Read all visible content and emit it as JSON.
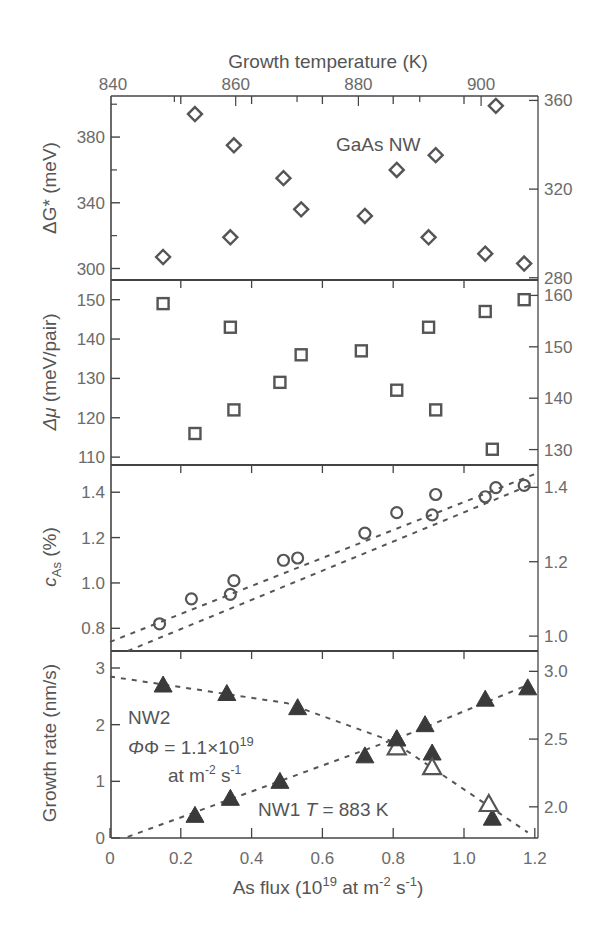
{
  "chart_data": {
    "type": "scatter",
    "layout": "4 vertically stacked panels sharing x-axis",
    "title": "",
    "top_axis": {
      "label": "Growth temperature (K)",
      "ticks": [
        840,
        860,
        880,
        900
      ],
      "range": [
        840,
        910
      ]
    },
    "xlabel": "As flux (10^19 at m^-2 s^-1)",
    "xlabel_parts": {
      "main": "As flux (10",
      "sup1": "19",
      "mid": " at m",
      "sup2": "-2",
      "mid2": " s",
      "sup3": "-1",
      "end": ")"
    },
    "xlim": [
      0,
      1.2
    ],
    "xticks": [
      "0",
      "0.2",
      "0.4",
      "0.6",
      "0.8",
      "1.0",
      "1.2"
    ],
    "grid": false,
    "panels": [
      {
        "id": "dG",
        "ylabel": "ΔG* (meV)",
        "ylim": [
          293,
          405
        ],
        "yticks": [
          300,
          340,
          380
        ],
        "yticks_minor": [
          320,
          360,
          400
        ],
        "right_ylim": [
          279,
          362
        ],
        "right_yticks": [
          280,
          320,
          360
        ],
        "annotation": "GaAs NW",
        "marker": "diamond-open",
        "series": [
          {
            "name": "ΔG*",
            "x": [
              0.15,
              0.24,
              0.34,
              0.35,
              0.49,
              0.54,
              0.72,
              0.81,
              0.9,
              0.92,
              1.06,
              1.09,
              1.17
            ],
            "y": [
              307,
              394,
              319,
              375,
              355,
              336,
              332,
              360,
              319,
              369,
              309,
              399,
              303
            ]
          }
        ]
      },
      {
        "id": "dmu",
        "ylabel": "Δμ (meV/pair)",
        "ylim": [
          108,
          155
        ],
        "yticks": [
          110,
          120,
          130,
          140,
          150
        ],
        "right_ylim": [
          127,
          163
        ],
        "right_yticks": [
          130,
          140,
          150,
          160
        ],
        "marker": "square-open",
        "series": [
          {
            "name": "Δμ",
            "x": [
              0.15,
              0.24,
              0.34,
              0.35,
              0.48,
              0.54,
              0.71,
              0.81,
              0.9,
              0.92,
              1.06,
              1.08,
              1.17
            ],
            "y": [
              149,
              116,
              143,
              122,
              129,
              136,
              137,
              127,
              143,
              122,
              147,
              112,
              150
            ]
          }
        ]
      },
      {
        "id": "cAs",
        "ylabel": "c_As (%)",
        "ylim": [
          0.7,
          1.52
        ],
        "yticks": [
          0.8,
          1.0,
          1.2,
          1.4
        ],
        "right_ylim": [
          0.96,
          1.46
        ],
        "right_yticks": [
          1.0,
          1.2,
          1.4
        ],
        "marker": "circle-open",
        "series": [
          {
            "name": "c_As",
            "x": [
              0.14,
              0.23,
              0.34,
              0.35,
              0.49,
              0.53,
              0.72,
              0.81,
              0.91,
              0.92,
              1.06,
              1.09,
              1.17
            ],
            "y": [
              0.82,
              0.93,
              0.95,
              1.01,
              1.1,
              1.11,
              1.22,
              1.31,
              1.3,
              1.39,
              1.38,
              1.42,
              1.43
            ]
          }
        ],
        "fit_lines": [
          {
            "x": [
              0.0,
              1.2
            ],
            "y": [
              0.74,
              1.48
            ],
            "style": "dashed"
          },
          {
            "x": [
              0.05,
              1.2
            ],
            "y": [
              0.7,
              1.44
            ],
            "style": "dashed"
          }
        ]
      },
      {
        "id": "growth",
        "ylabel": "Growth rate (nm/s)",
        "ylim": [
          0,
          3.3
        ],
        "yticks": [
          0,
          1,
          2,
          3
        ],
        "right_ylim": [
          1.77,
          3.15
        ],
        "right_yticks": [
          2.0,
          2.5,
          3.0
        ],
        "annotations": [
          {
            "text": "NW2",
            "x": 0.06,
            "y": 2.05
          },
          {
            "text": "Φ = 1.1×10^19",
            "x": 0.06,
            "y": 1.55
          },
          {
            "text": "at m^-2 s^-1",
            "x": 0.18,
            "y": 1.05
          },
          {
            "text": "NW1  T = 883 K",
            "x": 0.42,
            "y": 0.35
          }
        ],
        "marker": "triangle",
        "series": [
          {
            "name": "NW2 (Φ = 1.1×10^19 at m^-2 s^-1, vs temperature)",
            "x": [
              0.15,
              0.33,
              0.53,
              0.81,
              0.91,
              1.08
            ],
            "y": [
              2.7,
              2.55,
              2.3,
              1.75,
              1.5,
              0.35
            ],
            "filled": true,
            "fit_line": {
              "x": [
                0.0,
                0.5,
                0.8,
                1.18
              ],
              "y": [
                2.85,
                2.38,
                1.7,
                0.1
              ]
            }
          },
          {
            "name": "NW2 open",
            "x": [
              0.81,
              0.91,
              1.07
            ],
            "y": [
              1.6,
              1.25,
              0.6
            ],
            "filled": false
          },
          {
            "name": "NW1 (T = 883 K, vs As flux)",
            "x": [
              0.24,
              0.34,
              0.48,
              0.72,
              0.81,
              0.89,
              1.06,
              1.18
            ],
            "y": [
              0.4,
              0.7,
              1.0,
              1.45,
              1.75,
              2.0,
              2.45,
              2.65
            ],
            "filled": true,
            "fit_line": {
              "x": [
                0.05,
                0.5,
                0.85,
                1.18
              ],
              "y": [
                0.02,
                1.05,
                1.85,
                2.7
              ]
            }
          }
        ]
      }
    ]
  },
  "labels": {
    "top_axis_title": "Growth temperature (K)",
    "x_axis_title_main": "As flux (10",
    "x_axis_sup1": "19",
    "x_axis_mid": " at m",
    "x_axis_sup2": "-2",
    "x_axis_mid2": " s",
    "x_axis_sup3": "-1",
    "x_axis_end": ")",
    "panel1_ylabel": "ΔG* (meV)",
    "panel2_ylabel_sym": "Δμ",
    "panel2_ylabel_unit": " (meV/pair)",
    "panel3_ylabel_c": "c",
    "panel3_ylabel_sub": "As",
    "panel3_ylabel_unit": " (%)",
    "panel4_ylabel": "Growth rate (nm/s)",
    "panel1_annotation": "GaAs NW",
    "nw2_label": "NW2",
    "phi_label_main": "Φ = 1.1×10",
    "phi_label_sup": "19",
    "phi_units_main": "at m",
    "phi_units_sup1": "-2",
    "phi_units_mid": " s",
    "phi_units_sup2": "-1",
    "nw1_label": "NW1",
    "nw1_T": "T",
    "nw1_T_value": " = 883 K"
  },
  "colors": {
    "axis": "#444444",
    "marker": "#555555",
    "marker_dark": "#3a3a3a",
    "tick_text": "#6b6b6b",
    "dashed_line": "#555555"
  }
}
